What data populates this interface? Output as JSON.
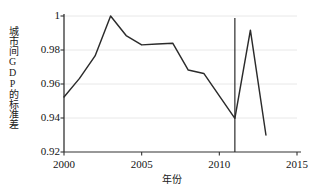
{
  "chart_data": {
    "type": "line",
    "title": "",
    "xlabel": "年份",
    "ylabel": "城市间GDP的标准差",
    "x": [
      2000,
      2001,
      2002,
      2003,
      2004,
      2005,
      2006,
      2007,
      2008,
      2009,
      2010,
      2011,
      2012,
      2013
    ],
    "values": [
      0.9524,
      0.9633,
      0.9765,
      1.0,
      0.9885,
      0.983,
      0.9835,
      0.984,
      0.9682,
      0.9662,
      0.953,
      0.9398,
      0.9917,
      0.93
    ],
    "series": [
      {
        "name": "城市间GDP的标准差",
        "values": [
          0.9524,
          0.9633,
          0.9765,
          1.0,
          0.9885,
          0.983,
          0.9835,
          0.984,
          0.9682,
          0.9662,
          0.953,
          0.9398,
          0.9917,
          0.93
        ]
      }
    ],
    "xlim": [
      2000,
      2015
    ],
    "ylim": [
      0.92,
      1.0
    ],
    "xticks": [
      2000,
      2005,
      2010,
      2015
    ],
    "xtick_labels": [
      "2000",
      "2005",
      "2010",
      "2015"
    ],
    "yticks": [
      0.92,
      0.94,
      0.96,
      0.98,
      1.0
    ],
    "ytick_labels": [
      "0.92",
      "0.94",
      "0.96",
      "0.98",
      "1"
    ],
    "grid": "horizontal",
    "legend": "none",
    "annotations": [
      {
        "type": "vertical-reference-line",
        "x": 2011,
        "label": ""
      }
    ],
    "colors": {
      "line": "#2b2b2b",
      "axis": "#333333",
      "grid": "#e8e8e8",
      "background": "#ffffff",
      "text": "#141414"
    }
  }
}
